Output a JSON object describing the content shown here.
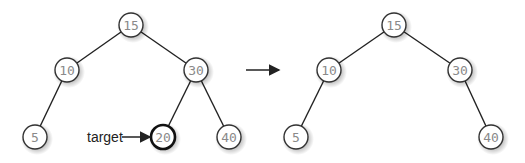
{
  "diagram": {
    "arrow": "transition-arrow",
    "target_label": "target",
    "before": {
      "nodes": [
        {
          "id": "b15",
          "value": "15",
          "x": 131,
          "y": 25
        },
        {
          "id": "b10",
          "value": "10",
          "x": 67,
          "y": 70
        },
        {
          "id": "b30",
          "value": "30",
          "x": 196,
          "y": 70
        },
        {
          "id": "b5",
          "value": "5",
          "x": 35,
          "y": 137
        },
        {
          "id": "b20",
          "value": "20",
          "x": 163,
          "y": 137,
          "highlighted": true
        },
        {
          "id": "b40",
          "value": "40",
          "x": 229,
          "y": 137
        }
      ],
      "edges": [
        [
          "b15",
          "b10"
        ],
        [
          "b15",
          "b30"
        ],
        [
          "b10",
          "b5"
        ],
        [
          "b30",
          "b20"
        ],
        [
          "b30",
          "b40"
        ]
      ]
    },
    "after": {
      "nodes": [
        {
          "id": "a15",
          "value": "15",
          "x": 394,
          "y": 25
        },
        {
          "id": "a10",
          "value": "10",
          "x": 329,
          "y": 70
        },
        {
          "id": "a30",
          "value": "30",
          "x": 460,
          "y": 70
        },
        {
          "id": "a5",
          "value": "5",
          "x": 296,
          "y": 137
        },
        {
          "id": "a40",
          "value": "40",
          "x": 491,
          "y": 137
        }
      ],
      "edges": [
        [
          "a15",
          "a10"
        ],
        [
          "a15",
          "a30"
        ],
        [
          "a10",
          "a5"
        ],
        [
          "a30",
          "a40"
        ]
      ]
    },
    "colors": {
      "edge": "#222222",
      "node_fill": "#ffffff",
      "node_stroke": "#333333",
      "label": "#8a8a8a",
      "highlight_stroke": "#111111"
    }
  }
}
